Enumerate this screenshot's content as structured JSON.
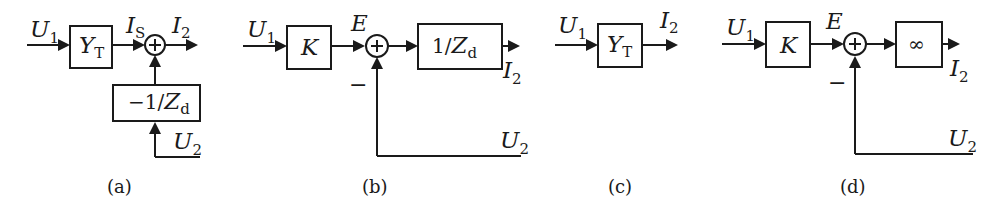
{
  "figure": {
    "panels": [
      {
        "caption": "(a)",
        "blocks": [
          {
            "main": "Y",
            "sub": "T"
          },
          {
            "prefix": "−1/",
            "main": "Z",
            "sub": "d"
          }
        ],
        "signals": {
          "in": {
            "main": "U",
            "sub": "1"
          },
          "mid": {
            "main": "I",
            "sub": "S"
          },
          "out": {
            "main": "I",
            "sub": "2"
          },
          "aux": {
            "main": "U",
            "sub": "2"
          }
        }
      },
      {
        "caption": "(b)",
        "blocks": [
          {
            "main": "K"
          },
          {
            "prefix": "1/",
            "main": "Z",
            "sub": "d"
          }
        ],
        "signals": {
          "in": {
            "main": "U",
            "sub": "1"
          },
          "mid": {
            "main": "E"
          },
          "out": {
            "main": "I",
            "sub": "2"
          },
          "aux": {
            "main": "U",
            "sub": "2"
          }
        },
        "feedback_sign": "−"
      },
      {
        "caption": "(c)",
        "blocks": [
          {
            "main": "Y",
            "sub": "T"
          }
        ],
        "signals": {
          "in": {
            "main": "U",
            "sub": "1"
          },
          "out": {
            "main": "I",
            "sub": "2"
          }
        }
      },
      {
        "caption": "(d)",
        "blocks": [
          {
            "main": "K"
          },
          {
            "main": "∞"
          }
        ],
        "signals": {
          "in": {
            "main": "U",
            "sub": "1"
          },
          "mid": {
            "main": "E"
          },
          "out": {
            "main": "I",
            "sub": "2"
          },
          "aux": {
            "main": "U",
            "sub": "2"
          }
        },
        "feedback_sign": "−"
      }
    ]
  }
}
